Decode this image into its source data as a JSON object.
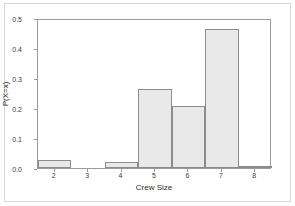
{
  "chart_data": {
    "type": "bar",
    "title": "",
    "subtitle": "",
    "xlabel": "Crew Size",
    "ylabel": "P(X=x)",
    "categories": [
      "2",
      "3",
      "4",
      "5",
      "6",
      "7",
      "8"
    ],
    "values": [
      0.028,
      0.0,
      0.019,
      0.264,
      0.207,
      0.463,
      0.005
    ],
    "xlim": [
      1.5,
      8.5
    ],
    "ylim": [
      0.0,
      0.5
    ],
    "yticks": [
      "0.0",
      "0.1",
      "0.2",
      "0.3",
      "0.4",
      "0.5"
    ],
    "ytick_values": [
      0.0,
      0.1,
      0.2,
      0.3,
      0.4,
      0.5
    ],
    "xticks": [
      "2",
      "3",
      "4",
      "5",
      "6",
      "7",
      "8"
    ],
    "grid": false,
    "legend": null,
    "legend_position": "none",
    "annotations": [],
    "series": [
      {
        "name": "P(X=x)",
        "values": [
          0.028,
          0.0,
          0.019,
          0.264,
          0.207,
          0.463,
          0.005
        ]
      }
    ]
  },
  "style": {
    "bar_fill": "#e9e9e9",
    "bar_border": "#8c8c8c",
    "axis_color": "#9a9a9a",
    "text_color": "#2a2a2a",
    "frame_color": "#d8d8d8",
    "background": "#ffffff"
  }
}
